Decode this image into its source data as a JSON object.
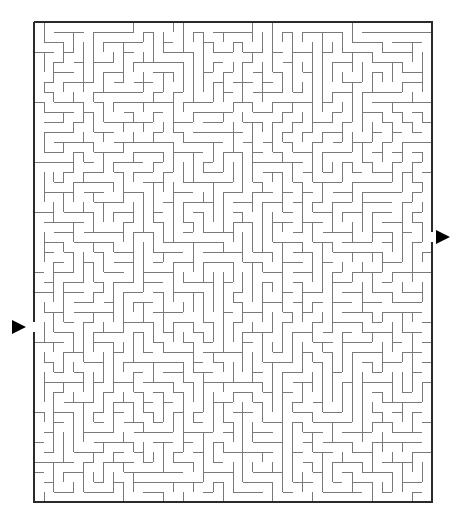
{
  "puzzle": {
    "type": "maze",
    "canvas": {
      "width": 457,
      "height": 528,
      "background": "#ffffff"
    },
    "frame": {
      "left": 34,
      "top": 22,
      "right": 432,
      "bottom": 502,
      "color": "#2a2a2a"
    },
    "grid": {
      "cols": 40,
      "rows": 48,
      "cell": 10,
      "wall_color": "#7a7a7a"
    },
    "entrance": {
      "side": "left",
      "row": 30,
      "arrow_icon": "right-pointing-triangle",
      "arrow_color": "#000000"
    },
    "exit": {
      "side": "right",
      "row": 21,
      "arrow_icon": "right-pointing-triangle",
      "arrow_color": "#000000"
    },
    "seed": 7
  }
}
